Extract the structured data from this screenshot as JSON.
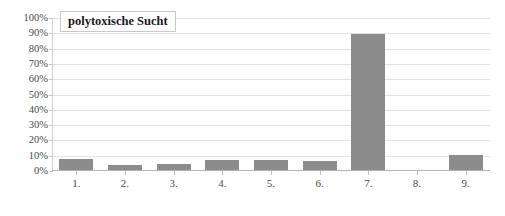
{
  "chart_data": {
    "type": "bar",
    "title": "polytoxische Sucht",
    "xlabel": "",
    "ylabel": "",
    "categories": [
      "1.",
      "2.",
      "3.",
      "4.",
      "5.",
      "6.",
      "7.",
      "8.",
      "9."
    ],
    "values": [
      7,
      3,
      4,
      6.5,
      6.5,
      6,
      89,
      0,
      10
    ],
    "ylim": [
      0,
      100
    ],
    "ytick_labels": [
      "100%",
      "90%",
      "80%",
      "70%",
      "60%",
      "50%",
      "40%",
      "30%",
      "20%",
      "10%",
      "0%"
    ],
    "ytick_values": [
      100,
      90,
      80,
      70,
      60,
      50,
      40,
      30,
      20,
      10,
      0
    ],
    "grid": true,
    "legend": false,
    "series": [
      {
        "name": "polytoxische Sucht",
        "values": [
          7,
          3,
          4,
          6.5,
          6.5,
          6,
          89,
          0,
          10
        ],
        "color": "#8c8c8c"
      }
    ]
  },
  "colors": {
    "bar": "#8c8c8c",
    "gridline": "#e2e2e2",
    "axis": "#b4b4b4",
    "text": "#4a4a4a",
    "title_text": "#1a1a1a",
    "title_border": "#c9c9c9",
    "background": "#ffffff"
  }
}
